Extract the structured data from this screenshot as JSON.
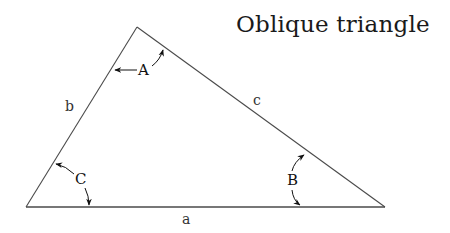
{
  "title": "Oblique triangle",
  "triangle": {
    "vertices": {
      "top": [
        137,
        27
      ],
      "bottom_left": [
        26,
        207
      ],
      "bottom_right": [
        385,
        207
      ]
    },
    "sides": [
      {
        "id": "a",
        "label": "a",
        "between": [
          "C",
          "B"
        ]
      },
      {
        "id": "b",
        "label": "b",
        "between": [
          "C",
          "A"
        ]
      },
      {
        "id": "c",
        "label": "c",
        "between": [
          "A",
          "B"
        ]
      }
    ],
    "angles": [
      {
        "id": "A",
        "label": "A",
        "vertex": "top"
      },
      {
        "id": "B",
        "label": "B",
        "vertex": "bottom_right"
      },
      {
        "id": "C",
        "label": "C",
        "vertex": "bottom_left"
      }
    ]
  },
  "colors": {
    "line": "#4a4a4a",
    "arrow": "#111111",
    "background": "#ffffff"
  }
}
